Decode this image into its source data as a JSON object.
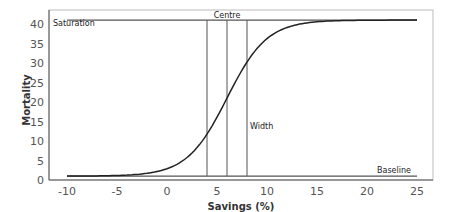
{
  "chart_data": {
    "type": "line",
    "title": "",
    "xlabel": "Savings (%)",
    "ylabel": "Mortality",
    "xlim": [
      -11.8,
      26.6
    ],
    "ylim": [
      0,
      43
    ],
    "xticks": [
      -10,
      -5,
      0,
      5,
      10,
      15,
      20,
      25
    ],
    "yticks": [
      0,
      5,
      10,
      15,
      20,
      25,
      30,
      35,
      40
    ],
    "grid": false,
    "legend": null,
    "series": [
      {
        "name": "Logistic mortality curve",
        "model": "logistic",
        "baseline": 1,
        "saturation": 41,
        "centre": 6,
        "scale": 2,
        "x": [
          -10,
          -8,
          -6,
          -4,
          -2,
          0,
          2,
          3,
          4,
          5,
          6,
          7,
          8,
          9,
          10,
          12,
          14,
          16,
          18,
          20,
          22,
          25
        ],
        "values": [
          1.0,
          1.0,
          1.1,
          1.3,
          1.7,
          2.9,
          5.8,
          8.3,
          11.8,
          15.9,
          21.0,
          26.1,
          30.2,
          33.7,
          36.3,
          39.0,
          40.3,
          40.7,
          40.9,
          41.0,
          41.0,
          41.0
        ]
      }
    ],
    "reference_lines": {
      "horizontal": [
        {
          "name": "Saturation",
          "y": 41,
          "x_from": -10,
          "x_to": 25
        },
        {
          "name": "Baseline",
          "y": 1,
          "x_from": -10,
          "x_to": 25
        }
      ],
      "vertical": [
        {
          "name": "width-left",
          "x": 4
        },
        {
          "name": "Centre",
          "x": 6
        },
        {
          "name": "width-right",
          "x": 8
        }
      ]
    },
    "annotations": [
      {
        "text": "Saturation",
        "x": -11.3,
        "y": 40
      },
      {
        "text": "Centre",
        "x": 6,
        "y": 42.3
      },
      {
        "text": "Width",
        "x": 8.3,
        "y": 13.5
      },
      {
        "text": "Baseline",
        "x": 21,
        "y": 1.5
      }
    ]
  },
  "labels": {
    "xlabel": "Savings (%)",
    "ylabel": "Mortality",
    "saturation": "Saturation",
    "centre": "Centre",
    "width": "Width",
    "baseline": "Baseline"
  },
  "colors": {
    "curve": "#222222",
    "reference": "#555555",
    "axes": "#555555"
  }
}
